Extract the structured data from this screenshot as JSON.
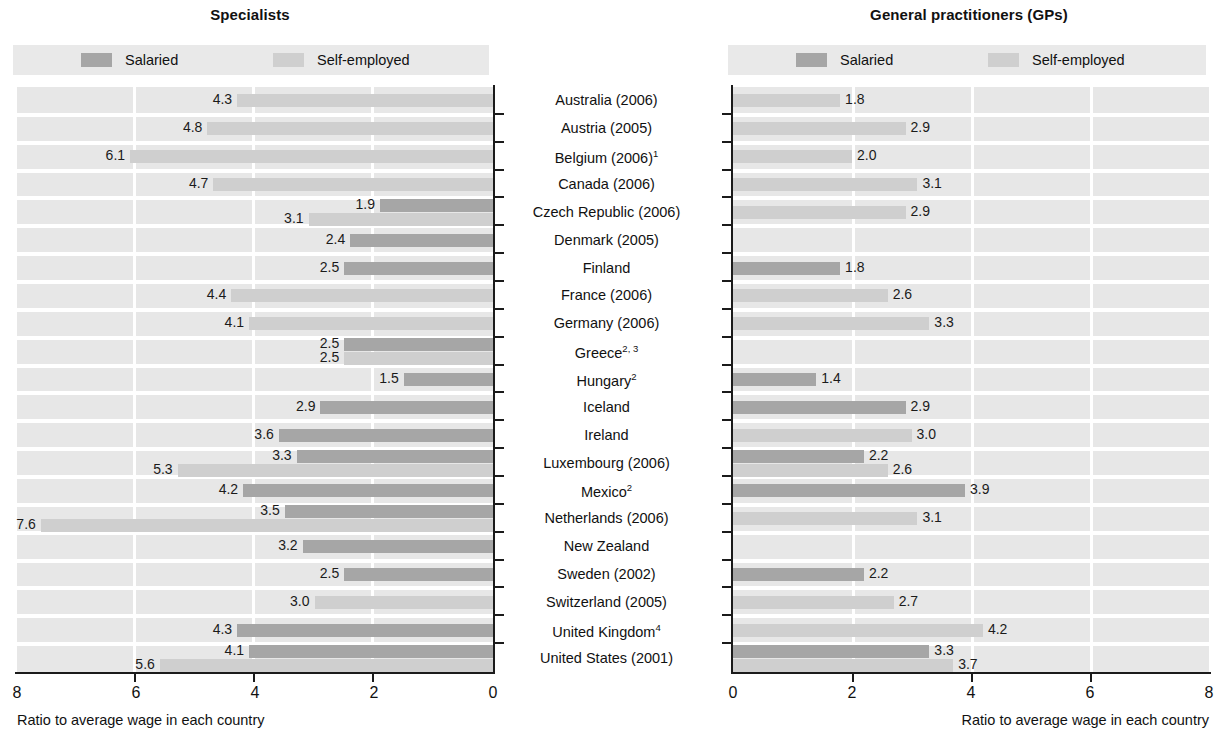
{
  "chart_data": {
    "type": "bar",
    "title": "",
    "orientation": "horizontal-diverging",
    "panels": [
      {
        "id": "specialists",
        "title": "Specialists",
        "direction": "right-to-left",
        "xlabel": "Ratio to average wage in each country",
        "xticks": [
          8,
          6,
          4,
          2,
          0
        ],
        "xlim": [
          8,
          0
        ],
        "gridlines": [
          6,
          4,
          2
        ]
      },
      {
        "id": "gps",
        "title": "General practitioners (GPs)",
        "direction": "left-to-right",
        "xlabel": "Ratio to average wage in each country",
        "xticks": [
          0,
          2,
          4,
          6,
          8
        ],
        "xlim": [
          0,
          8
        ],
        "gridlines": [
          2,
          4,
          6
        ]
      }
    ],
    "legend": {
      "position": "top",
      "entries": [
        {
          "name": "Salaried",
          "color": "#a6a6a6"
        },
        {
          "name": "Self-employed",
          "color": "#cfcfcf"
        }
      ]
    },
    "categories": [
      "Australia (2006)",
      "Austria (2005)",
      "Belgium (2006)",
      "Canada (2006)",
      "Czech Republic (2006)",
      "Denmark (2005)",
      "Finland",
      "France (2006)",
      "Germany (2006)",
      "Greece",
      "Hungary",
      "Iceland",
      "Ireland",
      "Luxembourg (2006)",
      "Mexico",
      "Netherlands (2006)",
      "New Zealand",
      "Sweden (2002)",
      "Switzerland (2005)",
      "United Kingdom",
      "United States (2001)"
    ],
    "category_footnotes": [
      "",
      "",
      "1",
      "",
      "",
      "",
      "",
      "",
      "",
      "2, 3",
      "2",
      "",
      "",
      "",
      "2",
      "",
      "",
      "",
      "",
      "4",
      ""
    ],
    "rows": [
      {
        "country": "Australia (2006)",
        "footnote": "",
        "specialists": {
          "salaried": null,
          "self_employed": 4.3
        },
        "gps": {
          "salaried": null,
          "self_employed": 1.8
        }
      },
      {
        "country": "Austria (2005)",
        "footnote": "",
        "specialists": {
          "salaried": null,
          "self_employed": 4.8
        },
        "gps": {
          "salaried": null,
          "self_employed": 2.9
        }
      },
      {
        "country": "Belgium (2006)",
        "footnote": "1",
        "specialists": {
          "salaried": null,
          "self_employed": 6.1
        },
        "gps": {
          "salaried": null,
          "self_employed": 2.0
        }
      },
      {
        "country": "Canada (2006)",
        "footnote": "",
        "specialists": {
          "salaried": null,
          "self_employed": 4.7
        },
        "gps": {
          "salaried": null,
          "self_employed": 3.1
        }
      },
      {
        "country": "Czech Republic (2006)",
        "footnote": "",
        "specialists": {
          "salaried": 1.9,
          "self_employed": 3.1
        },
        "gps": {
          "salaried": null,
          "self_employed": 2.9
        }
      },
      {
        "country": "Denmark (2005)",
        "footnote": "",
        "specialists": {
          "salaried": 2.4,
          "self_employed": null
        },
        "gps": {
          "salaried": null,
          "self_employed": null
        }
      },
      {
        "country": "Finland",
        "footnote": "",
        "specialists": {
          "salaried": 2.5,
          "self_employed": null
        },
        "gps": {
          "salaried": 1.8,
          "self_employed": null
        }
      },
      {
        "country": "France (2006)",
        "footnote": "",
        "specialists": {
          "salaried": null,
          "self_employed": 4.4
        },
        "gps": {
          "salaried": null,
          "self_employed": 2.6
        }
      },
      {
        "country": "Germany (2006)",
        "footnote": "",
        "specialists": {
          "salaried": null,
          "self_employed": 4.1
        },
        "gps": {
          "salaried": null,
          "self_employed": 3.3
        }
      },
      {
        "country": "Greece",
        "footnote": "2, 3",
        "specialists": {
          "salaried": 2.5,
          "self_employed": 2.5
        },
        "gps": {
          "salaried": null,
          "self_employed": null
        }
      },
      {
        "country": "Hungary",
        "footnote": "2",
        "specialists": {
          "salaried": 1.5,
          "self_employed": null
        },
        "gps": {
          "salaried": 1.4,
          "self_employed": null
        }
      },
      {
        "country": "Iceland",
        "footnote": "",
        "specialists": {
          "salaried": 2.9,
          "self_employed": null
        },
        "gps": {
          "salaried": 2.9,
          "self_employed": null
        }
      },
      {
        "country": "Ireland",
        "footnote": "",
        "specialists": {
          "salaried": 3.6,
          "self_employed": null
        },
        "gps": {
          "salaried": null,
          "self_employed": 3.0
        }
      },
      {
        "country": "Luxembourg (2006)",
        "footnote": "",
        "specialists": {
          "salaried": 3.3,
          "self_employed": 5.3
        },
        "gps": {
          "salaried": 2.2,
          "self_employed": 2.6
        }
      },
      {
        "country": "Mexico",
        "footnote": "2",
        "specialists": {
          "salaried": 4.2,
          "self_employed": null
        },
        "gps": {
          "salaried": 3.9,
          "self_employed": null
        }
      },
      {
        "country": "Netherlands (2006)",
        "footnote": "",
        "specialists": {
          "salaried": 3.5,
          "self_employed": 7.6
        },
        "gps": {
          "salaried": null,
          "self_employed": 3.1
        }
      },
      {
        "country": "New Zealand",
        "footnote": "",
        "specialists": {
          "salaried": 3.2,
          "self_employed": null
        },
        "gps": {
          "salaried": null,
          "self_employed": null
        }
      },
      {
        "country": "Sweden (2002)",
        "footnote": "",
        "specialists": {
          "salaried": 2.5,
          "self_employed": null
        },
        "gps": {
          "salaried": 2.2,
          "self_employed": null
        }
      },
      {
        "country": "Switzerland (2005)",
        "footnote": "",
        "specialists": {
          "salaried": null,
          "self_employed": 3.0
        },
        "gps": {
          "salaried": null,
          "self_employed": 2.7
        }
      },
      {
        "country": "United Kingdom",
        "footnote": "4",
        "specialists": {
          "salaried": 4.3,
          "self_employed": null
        },
        "gps": {
          "salaried": null,
          "self_employed": 4.2
        }
      },
      {
        "country": "United States (2001)",
        "footnote": "",
        "specialists": {
          "salaried": 4.1,
          "self_employed": 5.6
        },
        "gps": {
          "salaried": 3.3,
          "self_employed": 3.7
        }
      }
    ]
  },
  "labels": {
    "specialists_title": "Specialists",
    "gps_title": "General practitioners (GPs)",
    "legend_salaried": "Salaried",
    "legend_self_employed": "Self-employed",
    "axis_caption": "Ratio to average wage in each country",
    "left_ticks": [
      "8",
      "6",
      "4",
      "2",
      "0"
    ],
    "right_ticks": [
      "0",
      "2",
      "4",
      "6",
      "8"
    ]
  }
}
